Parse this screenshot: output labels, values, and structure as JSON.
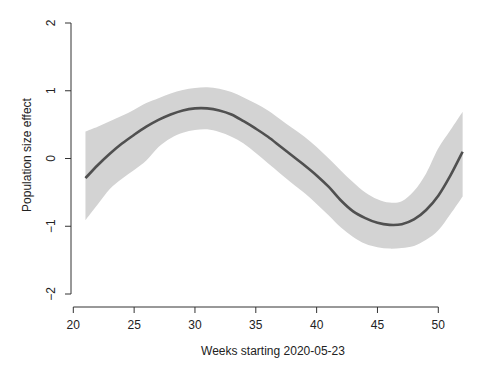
{
  "chart_data": {
    "type": "line",
    "title": "",
    "xlabel": "Weeks starting 2020-05-23",
    "ylabel": "Population size effect",
    "xlim": [
      20,
      52
    ],
    "ylim": [
      -2,
      2
    ],
    "x_ticks": [
      20,
      25,
      30,
      35,
      40,
      45,
      50
    ],
    "y_ticks": [
      -2,
      -1,
      0,
      1,
      2
    ],
    "grid": false,
    "legend": null,
    "series": [
      {
        "name": "fit",
        "color": "#505050",
        "x": [
          21,
          22,
          23,
          24,
          25,
          26,
          27,
          28,
          29,
          30,
          31,
          32,
          33,
          34,
          35,
          36,
          37,
          38,
          39,
          40,
          41,
          42,
          43,
          44,
          45,
          46,
          47,
          48,
          49,
          50,
          51,
          52
        ],
        "values": [
          -0.29,
          -0.1,
          0.07,
          0.22,
          0.35,
          0.47,
          0.57,
          0.65,
          0.71,
          0.74,
          0.74,
          0.71,
          0.65,
          0.55,
          0.44,
          0.32,
          0.18,
          0.04,
          -0.1,
          -0.25,
          -0.42,
          -0.62,
          -0.78,
          -0.88,
          -0.95,
          -0.98,
          -0.97,
          -0.9,
          -0.76,
          -0.55,
          -0.25,
          0.1
        ]
      }
    ],
    "confidence_band": {
      "color": "#d3d3d3",
      "x": [
        21,
        22,
        23,
        24,
        25,
        26,
        27,
        28,
        29,
        30,
        31,
        32,
        33,
        34,
        35,
        36,
        37,
        38,
        39,
        40,
        41,
        42,
        43,
        44,
        45,
        46,
        47,
        48,
        49,
        50,
        51,
        52
      ],
      "upper": [
        0.4,
        0.47,
        0.55,
        0.63,
        0.72,
        0.82,
        0.89,
        0.96,
        1.01,
        1.04,
        1.05,
        1.03,
        0.98,
        0.9,
        0.81,
        0.71,
        0.58,
        0.45,
        0.32,
        0.17,
        0.0,
        -0.18,
        -0.35,
        -0.5,
        -0.6,
        -0.65,
        -0.63,
        -0.48,
        -0.22,
        0.15,
        0.42,
        0.69
      ],
      "lower": [
        -0.91,
        -0.68,
        -0.45,
        -0.3,
        -0.17,
        -0.03,
        0.17,
        0.3,
        0.38,
        0.42,
        0.43,
        0.39,
        0.32,
        0.22,
        0.08,
        -0.07,
        -0.22,
        -0.37,
        -0.51,
        -0.67,
        -0.84,
        -1.02,
        -1.16,
        -1.26,
        -1.31,
        -1.33,
        -1.32,
        -1.29,
        -1.2,
        -1.06,
        -0.82,
        -0.56
      ]
    }
  },
  "layout": {
    "plot_left_px": 73.3,
    "plot_right_px": 438.3,
    "x_at_left": 20,
    "x_at_right": 50,
    "y_top_px": 23,
    "y_bottom_px": 294,
    "y_at_top": 2,
    "y_at_bottom": -2,
    "y_axis_x_px": 71,
    "x_axis_y_px": 307
  }
}
